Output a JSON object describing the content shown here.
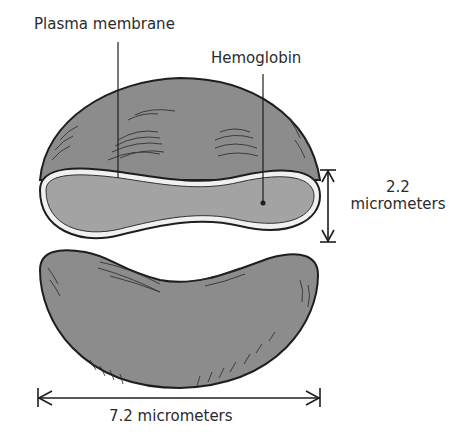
{
  "figure": {
    "labels": {
      "plasma_membrane": "Plasma membrane",
      "hemoglobin": "Hemoglobin",
      "thickness_value": "2.2",
      "thickness_unit": "micrometers",
      "diameter": "7.2 micrometers"
    },
    "colors": {
      "cell_fill": "#8c8c8c",
      "cut_face_fill": "#a3a3a3",
      "membrane": "#f0f0f0",
      "outline": "#1e1e1e",
      "background": "#ffffff"
    }
  }
}
